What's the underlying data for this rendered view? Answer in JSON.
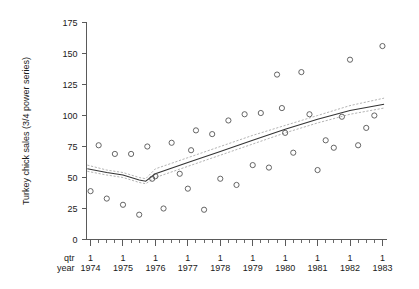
{
  "chart_data": {
    "type": "scatter",
    "title": "",
    "subtitle": "",
    "xlabel": "",
    "ylabel": "Turkey chick sales (3/4 power series)",
    "xlim": [
      1973.875,
      1983.125
    ],
    "ylim": [
      0,
      175
    ],
    "grid": false,
    "legend": null,
    "y_ticks": [
      0,
      25,
      50,
      75,
      100,
      125,
      150,
      175
    ],
    "y_tick_labels": [
      "0",
      "25",
      "50",
      "75",
      "100",
      "125",
      "150",
      "175"
    ],
    "x_axis": {
      "row_labels": [
        "qtr",
        "year"
      ],
      "major_tick_quarter_label": "1",
      "year_labels": [
        "1974",
        "1975",
        "1976",
        "1977",
        "1978",
        "1979",
        "1980",
        "1981",
        "1982",
        "1983"
      ],
      "minor_ticks_per_year": 4,
      "note": "quarterly ticks; labelled tick is quarter 1 of each year"
    },
    "series": [
      {
        "name": "observed",
        "marker": "open-circle",
        "points": [
          {
            "x": 1974.0,
            "y": 39
          },
          {
            "x": 1974.25,
            "y": 76
          },
          {
            "x": 1974.5,
            "y": 33
          },
          {
            "x": 1974.75,
            "y": 69
          },
          {
            "x": 1975.0,
            "y": 28
          },
          {
            "x": 1975.25,
            "y": 69
          },
          {
            "x": 1975.5,
            "y": 20
          },
          {
            "x": 1975.75,
            "y": 75
          },
          {
            "x": 1976.0,
            "y": 51
          },
          {
            "x": 1976.25,
            "y": 25
          },
          {
            "x": 1976.5,
            "y": 78
          },
          {
            "x": 1976.75,
            "y": 53
          },
          {
            "x": 1977.0,
            "y": 41
          },
          {
            "x": 1977.25,
            "y": 88
          },
          {
            "x": 1977.5,
            "y": 24
          },
          {
            "x": 1977.75,
            "y": 85
          },
          {
            "x": 1978.0,
            "y": 49
          },
          {
            "x": 1978.25,
            "y": 96
          },
          {
            "x": 1978.5,
            "y": 44
          },
          {
            "x": 1978.75,
            "y": 101
          },
          {
            "x": 1979.0,
            "y": 60
          },
          {
            "x": 1979.25,
            "y": 102
          },
          {
            "x": 1979.5,
            "y": 58
          },
          {
            "x": 1979.75,
            "y": 133
          },
          {
            "x": 1980.0,
            "y": 86
          },
          {
            "x": 1980.25,
            "y": 70
          },
          {
            "x": 1980.5,
            "y": 135
          },
          {
            "x": 1980.75,
            "y": 101
          },
          {
            "x": 1981.0,
            "y": 56
          },
          {
            "x": 1981.25,
            "y": 80
          },
          {
            "x": 1981.5,
            "y": 74
          },
          {
            "x": 1981.75,
            "y": 99
          },
          {
            "x": 1982.0,
            "y": 145
          },
          {
            "x": 1982.25,
            "y": 76
          },
          {
            "x": 1982.5,
            "y": 90
          },
          {
            "x": 1982.75,
            "y": 100
          },
          {
            "x": 1983.0,
            "y": 156
          },
          {
            "x": 1975.9,
            "y": 49
          },
          {
            "x": 1977.1,
            "y": 72
          },
          {
            "x": 1979.9,
            "y": 106
          }
        ]
      },
      {
        "name": "fitted trend",
        "style": "solid-line",
        "points": [
          {
            "x": 1973.9,
            "y": 57
          },
          {
            "x": 1974.5,
            "y": 54
          },
          {
            "x": 1975.0,
            "y": 52
          },
          {
            "x": 1975.5,
            "y": 48
          },
          {
            "x": 1975.7,
            "y": 47
          },
          {
            "x": 1976.0,
            "y": 53
          },
          {
            "x": 1977.0,
            "y": 62
          },
          {
            "x": 1978.0,
            "y": 71
          },
          {
            "x": 1979.0,
            "y": 80
          },
          {
            "x": 1980.0,
            "y": 89
          },
          {
            "x": 1981.0,
            "y": 97
          },
          {
            "x": 1982.0,
            "y": 104
          },
          {
            "x": 1983.05,
            "y": 109
          }
        ]
      },
      {
        "name": "upper confidence band",
        "style": "dotted-line",
        "points": [
          {
            "x": 1973.9,
            "y": 60
          },
          {
            "x": 1974.5,
            "y": 56
          },
          {
            "x": 1975.0,
            "y": 54
          },
          {
            "x": 1975.5,
            "y": 50
          },
          {
            "x": 1975.7,
            "y": 49
          },
          {
            "x": 1976.0,
            "y": 57
          },
          {
            "x": 1977.0,
            "y": 66
          },
          {
            "x": 1978.0,
            "y": 75
          },
          {
            "x": 1979.0,
            "y": 84
          },
          {
            "x": 1980.0,
            "y": 92
          },
          {
            "x": 1981.0,
            "y": 100
          },
          {
            "x": 1982.0,
            "y": 108
          },
          {
            "x": 1983.05,
            "y": 114
          }
        ]
      },
      {
        "name": "lower confidence band",
        "style": "dotted-line",
        "points": [
          {
            "x": 1973.9,
            "y": 55
          },
          {
            "x": 1974.5,
            "y": 52
          },
          {
            "x": 1975.0,
            "y": 50
          },
          {
            "x": 1975.5,
            "y": 46
          },
          {
            "x": 1975.7,
            "y": 45
          },
          {
            "x": 1976.0,
            "y": 50
          },
          {
            "x": 1977.0,
            "y": 59
          },
          {
            "x": 1978.0,
            "y": 68
          },
          {
            "x": 1979.0,
            "y": 77
          },
          {
            "x": 1980.0,
            "y": 86
          },
          {
            "x": 1981.0,
            "y": 94
          },
          {
            "x": 1982.0,
            "y": 101
          },
          {
            "x": 1983.05,
            "y": 106
          }
        ]
      }
    ]
  },
  "colors": {
    "background": "#ffffff",
    "axis": "#5a5a5a",
    "marker": "#555555",
    "fit": "#333333",
    "band": "#9a9a9a",
    "text": "#1a1a1a"
  }
}
